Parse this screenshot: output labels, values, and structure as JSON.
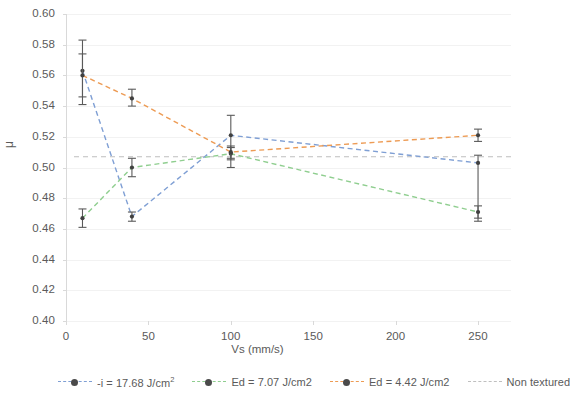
{
  "chart_data": {
    "type": "line",
    "title": "",
    "subtitle": "",
    "xlabel": "Vs (mm/s)",
    "ylabel": "μ",
    "xlim": [
      0,
      270
    ],
    "ylim": [
      0.4,
      0.6
    ],
    "xticks": [
      0,
      50,
      100,
      150,
      200,
      250
    ],
    "yticks": [
      0.4,
      0.42,
      0.44,
      0.46,
      0.48,
      0.5,
      0.52,
      0.54,
      0.56,
      0.58,
      0.6
    ],
    "ytick_labels": [
      "0.40",
      "0.42",
      "0.44",
      "0.46",
      "0.48",
      "0.50",
      "0.52",
      "0.54",
      "0.56",
      "0.58",
      "0.60"
    ],
    "xtick_labels": [
      "0",
      "50",
      "100",
      "150",
      "200",
      "250"
    ],
    "grid": "horizontal",
    "legend_position": "bottom",
    "x": [
      10,
      40,
      100,
      250
    ],
    "series": [
      {
        "name": "-i = 17.68 J/cm²",
        "color": "#7f9fd4",
        "marker_color": "#404040",
        "linestyle": "dashed",
        "values": [
          0.563,
          0.468,
          0.521,
          0.503
        ],
        "error_low": [
          0.541,
          0.465,
          0.5,
          0.465
        ],
        "error_high": [
          0.583,
          0.471,
          0.534,
          0.508
        ]
      },
      {
        "name": "Ed = 7.07 J/cm2",
        "color": "#8fce8f",
        "marker_color": "#404040",
        "linestyle": "dashed",
        "values": [
          0.467,
          0.5,
          0.509,
          0.471
        ],
        "error_low": [
          0.461,
          0.494,
          0.505,
          0.467
        ],
        "error_high": [
          0.473,
          0.506,
          0.513,
          0.475
        ]
      },
      {
        "name": "Ed = 4.42 J/cm2",
        "color": "#ed9b54",
        "marker_color": "#404040",
        "linestyle": "dashed",
        "values": [
          0.56,
          0.545,
          0.51,
          0.521
        ],
        "error_low": [
          0.546,
          0.54,
          0.506,
          0.517
        ],
        "error_high": [
          0.574,
          0.551,
          0.514,
          0.525
        ]
      }
    ],
    "reference_line": {
      "name": "Non textured",
      "color": "#bfbfbf",
      "linestyle": "dashed",
      "value": 0.507,
      "orientation": "horizontal"
    }
  },
  "legend": {
    "items": [
      {
        "label_prefix": "-i = 17.68 J/cm",
        "label_sup": "2",
        "color": "#7f9fd4",
        "has_marker": true
      },
      {
        "label_prefix": "Ed = 7.07 J/cm2",
        "label_sup": "",
        "color": "#8fce8f",
        "has_marker": true
      },
      {
        "label_prefix": "Ed = 4.42 J/cm2",
        "label_sup": "",
        "color": "#ed9b54",
        "has_marker": true
      },
      {
        "label_prefix": "Non textured",
        "label_sup": "",
        "color": "#bfbfbf",
        "has_marker": false
      }
    ]
  }
}
